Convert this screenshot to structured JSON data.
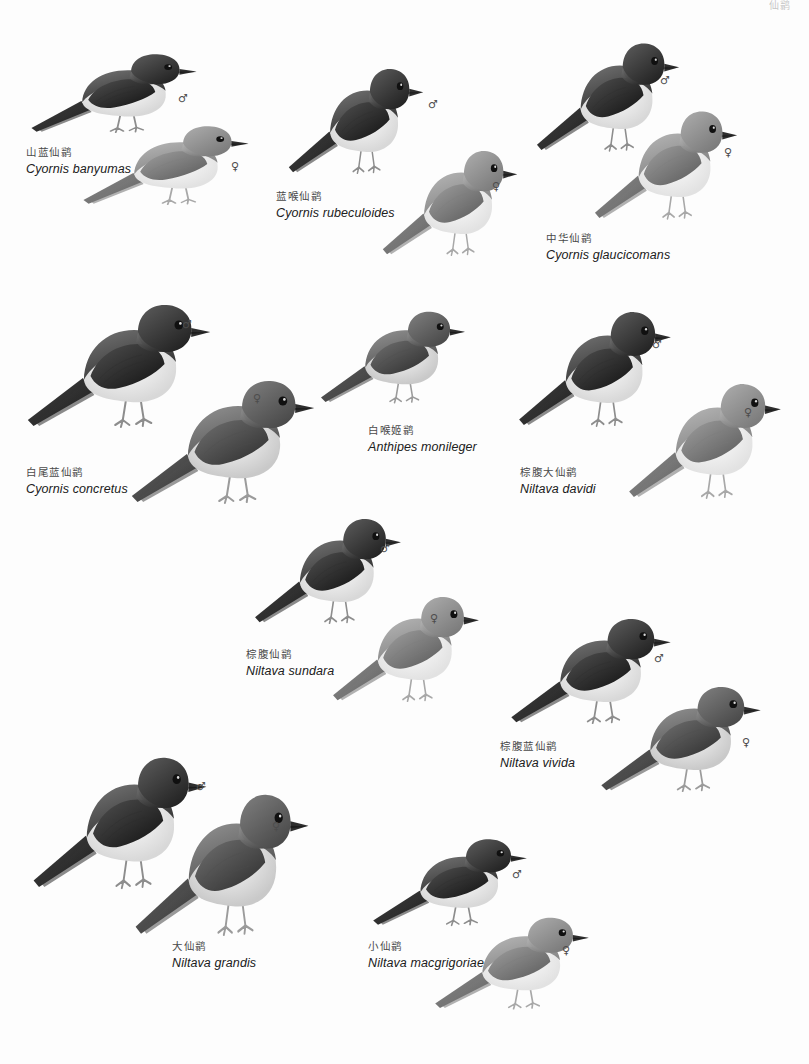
{
  "page": {
    "header_text": "仙鹟",
    "background": "#fdfdfd",
    "plate_type": "bird-field-guide-plate",
    "symbols": {
      "male": "♂",
      "female": "♀"
    }
  },
  "species": [
    {
      "id": "cyornis-banyumas",
      "cn": "山蓝仙鹟",
      "sci": "Cyornis banyumas",
      "label_x": 26,
      "label_y": 146,
      "birds": [
        {
          "sex": "♂",
          "x": 28,
          "y": 46,
          "w": 172,
          "h": 96,
          "tone": "dark",
          "flip": false,
          "sym_x": 178,
          "sym_y": 92
        },
        {
          "sex": "♀",
          "x": 80,
          "y": 118,
          "w": 172,
          "h": 96,
          "tone": "light",
          "flip": false,
          "sym_x": 231,
          "sym_y": 160
        }
      ]
    },
    {
      "id": "cyornis-rubeculoides",
      "cn": "蓝喉仙鹟",
      "sci": "Cyornis rubeculoides",
      "label_x": 276,
      "label_y": 190,
      "birds": [
        {
          "sex": "♂",
          "x": 286,
          "y": 58,
          "w": 140,
          "h": 128,
          "tone": "dark",
          "flip": false,
          "sym_x": 428,
          "sym_y": 98
        },
        {
          "sex": "♀",
          "x": 380,
          "y": 140,
          "w": 140,
          "h": 128,
          "tone": "light",
          "flip": false,
          "sym_x": 492,
          "sym_y": 180
        }
      ]
    },
    {
      "id": "cyornis-glaucicomans",
      "cn": "中华仙鹟",
      "sci": "Cyornis glaucicomans",
      "label_x": 546,
      "label_y": 232,
      "birds": [
        {
          "sex": "♂",
          "x": 534,
          "y": 32,
          "w": 148,
          "h": 132,
          "tone": "dark",
          "flip": false,
          "sym_x": 660,
          "sym_y": 74
        },
        {
          "sex": "♀",
          "x": 592,
          "y": 100,
          "w": 148,
          "h": 132,
          "tone": "light",
          "flip": false,
          "sym_x": 724,
          "sym_y": 146
        }
      ]
    },
    {
      "id": "cyornis-concretus",
      "cn": "白尾蓝仙鹟",
      "sci": "Cyornis concretus",
      "label_x": 26,
      "label_y": 466,
      "birds": [
        {
          "sex": "♂",
          "x": 24,
          "y": 292,
          "w": 190,
          "h": 150,
          "tone": "dark",
          "flip": false,
          "sym_x": 182,
          "sym_y": 318
        },
        {
          "sex": "♀",
          "x": 128,
          "y": 368,
          "w": 190,
          "h": 150,
          "tone": "mid",
          "flip": false,
          "sym_x": 253,
          "sym_y": 392
        }
      ]
    },
    {
      "id": "anthipes-monileger",
      "cn": "白喉姬鹟",
      "sci": "Anthipes monileger",
      "label_x": 368,
      "label_y": 424,
      "birds": [
        {
          "sex": "",
          "x": 318,
          "y": 302,
          "w": 150,
          "h": 112,
          "tone": "mid",
          "flip": false,
          "sym_x": 0,
          "sym_y": 0
        }
      ]
    },
    {
      "id": "niltava-davidi",
      "cn": "棕腹大仙鹟",
      "sci": "Niltava davidi",
      "label_x": 520,
      "label_y": 466,
      "birds": [
        {
          "sex": "♂",
          "x": 516,
          "y": 300,
          "w": 158,
          "h": 140,
          "tone": "dark",
          "flip": false,
          "sym_x": 652,
          "sym_y": 338
        },
        {
          "sex": "♀",
          "x": 626,
          "y": 372,
          "w": 158,
          "h": 140,
          "tone": "light",
          "flip": false,
          "sym_x": 744,
          "sym_y": 406
        }
      ]
    },
    {
      "id": "niltava-sundara",
      "cn": "棕腹仙鹟",
      "sci": "Niltava sundara",
      "label_x": 246,
      "label_y": 648,
      "birds": [
        {
          "sex": "♂",
          "x": 252,
          "y": 508,
          "w": 152,
          "h": 128,
          "tone": "dark",
          "flip": false,
          "sym_x": 380,
          "sym_y": 542
        },
        {
          "sex": "♀",
          "x": 330,
          "y": 586,
          "w": 152,
          "h": 128,
          "tone": "light",
          "flip": false,
          "sym_x": 430,
          "sym_y": 612
        }
      ]
    },
    {
      "id": "niltava-vivida",
      "cn": "棕腹蓝仙鹟",
      "sci": "Niltava vivida",
      "label_x": 500,
      "label_y": 740,
      "birds": [
        {
          "sex": "♂",
          "x": 508,
          "y": 608,
          "w": 166,
          "h": 128,
          "tone": "dark",
          "flip": false,
          "sym_x": 654,
          "sym_y": 652
        },
        {
          "sex": "♀",
          "x": 598,
          "y": 676,
          "w": 166,
          "h": 128,
          "tone": "mid",
          "flip": false,
          "sym_x": 742,
          "sym_y": 736
        }
      ]
    },
    {
      "id": "niltava-grandis",
      "cn": "大仙鹟",
      "sci": "Niltava grandis",
      "label_x": 172,
      "label_y": 940,
      "birds": [
        {
          "sex": "♂",
          "x": 30,
          "y": 744,
          "w": 180,
          "h": 160,
          "tone": "dark",
          "flip": false,
          "sym_x": 196,
          "sym_y": 780
        },
        {
          "sex": "♀",
          "x": 132,
          "y": 780,
          "w": 180,
          "h": 172,
          "tone": "mid",
          "flip": false,
          "sym_x": 272,
          "sym_y": 820
        }
      ]
    },
    {
      "id": "niltava-macgrigoriae",
      "cn": "小仙鹟",
      "sci": "Niltava macgrigoriae",
      "label_x": 368,
      "label_y": 940,
      "birds": [
        {
          "sex": "♂",
          "x": 370,
          "y": 830,
          "w": 160,
          "h": 106,
          "tone": "dark",
          "flip": false,
          "sym_x": 512,
          "sym_y": 868
        },
        {
          "sex": "♀",
          "x": 432,
          "y": 908,
          "w": 160,
          "h": 112,
          "tone": "light",
          "flip": false,
          "sym_x": 562,
          "sym_y": 944
        }
      ]
    }
  ]
}
